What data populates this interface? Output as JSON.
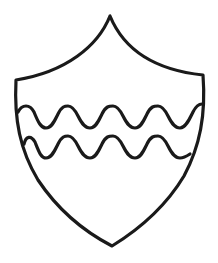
{
  "figure": {
    "subject": "Heraldic shield with two wavy bars",
    "charge": "two bars wavy",
    "line_color": "#1a1a1a",
    "fill_color": "#ffffff",
    "background_color": "#ffffff"
  },
  "shield": {
    "outline": "M110,16 C98,46 66,72 16,80 C14,120 20,150 38,180 C58,210 85,232 112,246 C138,230 166,206 184,176 C200,146 206,115 203,75 C155,70 124,50 110,16 Z",
    "stroke_width": 3.2
  },
  "waves": [
    {
      "name": "upper-wavy-bar",
      "path": "M18,112 C22,104 30,104 34,112 C38,122 41,128 46,128 C52,128 55,120 58,114 C62,106 65,106 68,106 C72,106 75,110 78,116 C82,124 85,128 90,128 C96,128 99,120 102,114 C106,106 109,106 113,106 C117,106 120,110 123,116 C127,124 130,128 135,128 C141,128 144,120 147,114 C151,106 154,106 158,106 C162,106 165,110 168,116 C172,124 175,128 180,128 C186,128 190,118 193,112 C196,106 199,104 202,104"
    },
    {
      "name": "lower-wavy-bar",
      "path": "M24,144 C26,136 31,135 35,142 C39,152 41,158 46,158 C52,158 55,150 58,144 C62,136 65,136 68,136 C72,136 75,140 78,146 C82,154 85,158 90,158 C96,158 99,150 102,144 C106,136 109,136 113,136 C117,136 120,140 123,146 C127,154 130,158 135,158 C141,158 144,150 147,144 C151,136 154,136 158,136 C162,136 165,140 168,146 C172,154 175,158 180,158 C184,158 187,156 190,154"
    }
  ]
}
